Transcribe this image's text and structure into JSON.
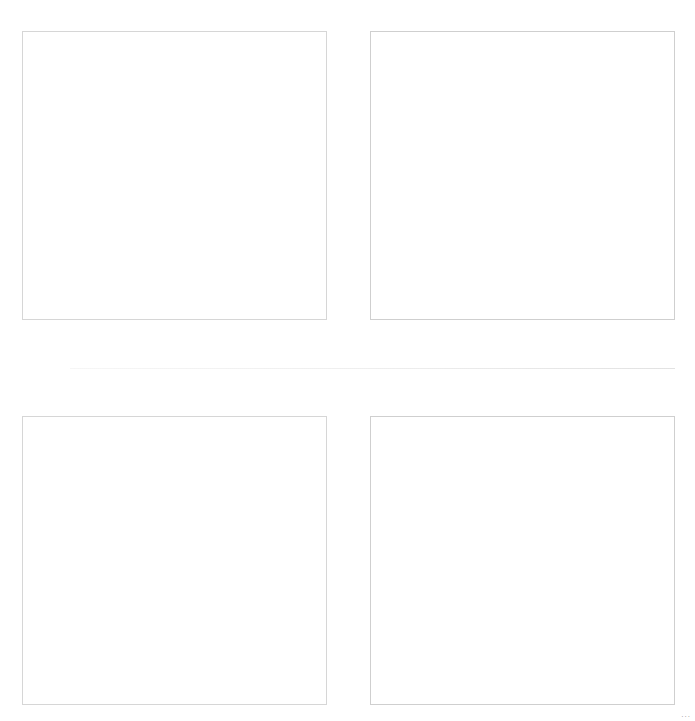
{
  "panels": [
    {
      "position": "top-left",
      "content": ""
    },
    {
      "position": "top-right",
      "content": ""
    },
    {
      "position": "bottom-left",
      "content": ""
    },
    {
      "position": "bottom-right",
      "content": ""
    }
  ],
  "corner_mark": "..."
}
